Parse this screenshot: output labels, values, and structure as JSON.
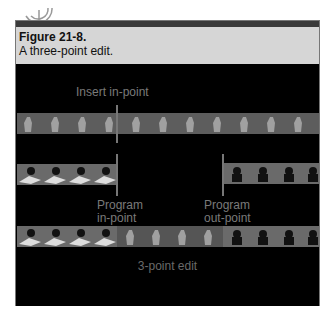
{
  "figure": {
    "number": "Figure 21-8.",
    "caption": "A three-point edit."
  },
  "diagram": {
    "labels": {
      "insert_in_point": "Insert in-point",
      "program_in_point_line1": "Program",
      "program_in_point_line2": "in-point",
      "program_out_point_line1": "Program",
      "program_out_point_line2": "out-point",
      "result": "3-point edit"
    },
    "tracks": [
      {
        "name": "source-clip",
        "content": "standing figure frames",
        "frames": 12
      },
      {
        "name": "program-before-edit",
        "segments": [
          "seated figure frames (left)",
          "gap",
          "group figure frames (right)"
        ]
      },
      {
        "name": "program-after-edit",
        "segments": [
          "seated figure frames",
          "inserted standing figure frames",
          "group figure frames"
        ]
      }
    ],
    "colors": {
      "background": "#000000",
      "caption_bg": "#d6d6d6",
      "label_text": "#7a7a7a",
      "marker_line": "#777777"
    }
  }
}
